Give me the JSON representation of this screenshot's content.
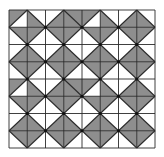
{
  "figure": {
    "rows": 8,
    "cols": 8,
    "bounds": {
      "x": 9,
      "y": 10,
      "width": 146,
      "height": 138
    },
    "colors": {
      "gray": "#8e8e8e",
      "white": "#ffffff",
      "line": "#2a2a2a"
    },
    "legend": "cells[r][c] = [diagonal, firstHalf, secondHalf]; diagonal '/' halves are [upper-left, lower-right]; diagonal '\\' halves are [upper-right, lower-left]; g = gray, w = white",
    "cells": [
      [
        [
          "/",
          "g",
          "w"
        ],
        [
          "\\",
          "w",
          "g"
        ],
        [
          "/",
          "w",
          "g"
        ],
        [
          "\\",
          "g",
          "g"
        ],
        [
          "/",
          "g",
          "w"
        ],
        [
          "\\",
          "w",
          "g"
        ],
        [
          "/",
          "w",
          "g"
        ],
        [
          "\\",
          "w",
          "g"
        ]
      ],
      [
        [
          "\\",
          "g",
          "w"
        ],
        [
          "/",
          "g",
          "w"
        ],
        [
          "\\",
          "g",
          "w"
        ],
        [
          "/",
          "g",
          "w"
        ],
        [
          "\\",
          "g",
          "w"
        ],
        [
          "/",
          "g",
          "w"
        ],
        [
          "\\",
          "g",
          "w"
        ],
        [
          "/",
          "g",
          "w"
        ]
      ],
      [
        [
          "/",
          "w",
          "g"
        ],
        [
          "\\",
          "w",
          "g"
        ],
        [
          "/",
          "w",
          "g"
        ],
        [
          "\\",
          "w",
          "g"
        ],
        [
          "/",
          "w",
          "g"
        ],
        [
          "\\",
          "w",
          "g"
        ],
        [
          "/",
          "w",
          "g"
        ],
        [
          "\\",
          "w",
          "g"
        ]
      ],
      [
        [
          "\\",
          "g",
          "w"
        ],
        [
          "/",
          "g",
          "w"
        ],
        [
          "\\",
          "g",
          "w"
        ],
        [
          "/",
          "g",
          "w"
        ],
        [
          "\\",
          "g",
          "w"
        ],
        [
          "/",
          "g",
          "w"
        ],
        [
          "\\",
          "g",
          "w"
        ],
        [
          "/",
          "g",
          "w"
        ]
      ],
      [
        [
          "/",
          "g",
          "w"
        ],
        [
          "\\",
          "w",
          "g"
        ],
        [
          "/",
          "w",
          "g"
        ],
        [
          "\\",
          "g",
          "g"
        ],
        [
          "/",
          "g",
          "w"
        ],
        [
          "\\",
          "w",
          "g"
        ],
        [
          "/",
          "w",
          "g"
        ],
        [
          "\\",
          "w",
          "g"
        ]
      ],
      [
        [
          "\\",
          "g",
          "w"
        ],
        [
          "/",
          "g",
          "w"
        ],
        [
          "\\",
          "g",
          "w"
        ],
        [
          "/",
          "g",
          "w"
        ],
        [
          "\\",
          "g",
          "w"
        ],
        [
          "/",
          "g",
          "w"
        ],
        [
          "\\",
          "g",
          "w"
        ],
        [
          "/",
          "g",
          "w"
        ]
      ],
      [
        [
          "/",
          "w",
          "g"
        ],
        [
          "\\",
          "w",
          "g"
        ],
        [
          "/",
          "w",
          "g"
        ],
        [
          "\\",
          "w",
          "g"
        ],
        [
          "/",
          "w",
          "g"
        ],
        [
          "\\",
          "w",
          "g"
        ],
        [
          "/",
          "w",
          "g"
        ],
        [
          "\\",
          "w",
          "g"
        ]
      ],
      [
        [
          "\\",
          "g",
          "w"
        ],
        [
          "/",
          "g",
          "w"
        ],
        [
          "\\",
          "g",
          "w"
        ],
        [
          "/",
          "g",
          "w"
        ],
        [
          "\\",
          "g",
          "w"
        ],
        [
          "/",
          "g",
          "w"
        ],
        [
          "\\",
          "g",
          "w"
        ],
        [
          "/",
          "g",
          "w"
        ]
      ]
    ],
    "dots": "at interior grid nodes where (col+row) is odd"
  }
}
